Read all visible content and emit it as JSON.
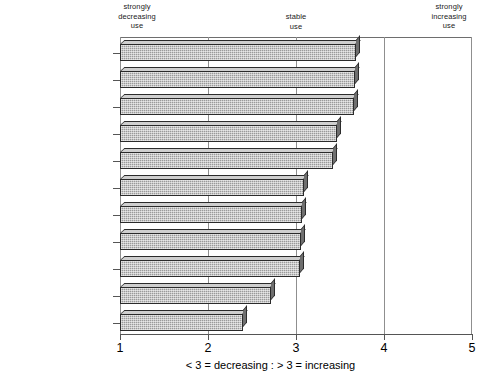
{
  "chart_data": {
    "type": "bar",
    "orientation": "horizontal",
    "title": "",
    "xlabel": "< 3 = decreasing : > 3 = increasing",
    "ylabel": "",
    "xlim": [
      1,
      5
    ],
    "xticks": [
      1,
      2,
      3,
      4,
      5
    ],
    "xtick_labels": [
      "1",
      "2",
      "3",
      "4",
      "5"
    ],
    "grid": true,
    "gridlines_at": [
      2,
      3,
      4
    ],
    "legend": "none",
    "categories": [
      "Ind. Particleboard",
      "Wood Veneer",
      "Hardwood Lumber",
      "MDF",
      "HD Laminates",
      "Plywood",
      "MD Laminates",
      "Hardboard",
      "Softwood Lumber",
      "Vinyl Overlays",
      "OSB"
    ],
    "values": [
      3.68,
      3.67,
      3.66,
      3.47,
      3.42,
      3.09,
      3.07,
      3.06,
      3.04,
      2.72,
      2.4
    ],
    "annotations": [
      "strongly\ndecreasing\nuse",
      "stable\nuse",
      "strongly\nincreasing\nuse"
    ]
  },
  "annotations": {
    "left": "strongly\ndecreasing\nuse",
    "middle": "stable\nuse",
    "right": "strongly\nincreasing\nuse"
  },
  "axis": {
    "caption": "< 3 = decreasing : > 3 = increasing",
    "tick_1": "1",
    "tick_2": "2",
    "tick_3": "3",
    "tick_4": "4",
    "tick_5": "5"
  },
  "colors": {
    "bar_face": "#9a9a9a",
    "bar_top": "#cfcfcf",
    "bar_side": "#6f6f6f",
    "outline": "#2b2b2b",
    "gridline": "#8f8f8f",
    "text": "#000000"
  }
}
